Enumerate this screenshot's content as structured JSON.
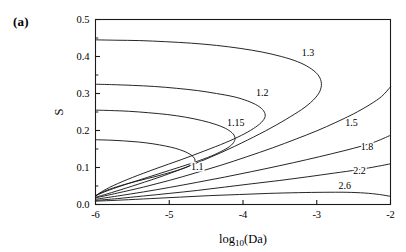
{
  "panel": {
    "label": "(a)"
  },
  "chart_data": {
    "type": "line",
    "title": "",
    "subtitle": "",
    "xlabel": "log10(Da)",
    "xlabel_base": "log",
    "xlabel_sub": "10",
    "xlabel_tail": "(Da)",
    "ylabel": "S",
    "xlim": [
      -6,
      -2
    ],
    "ylim": [
      0.0,
      0.5
    ],
    "grid": false,
    "legend_position": "inline-contour-labels",
    "xticks": [
      "-6",
      "-5",
      "-4",
      "-3",
      "-2"
    ],
    "xtick_values": [
      -6,
      -5,
      -4,
      -3,
      -2
    ],
    "yticks": [
      "0.0",
      "0.1",
      "0.2",
      "0.3",
      "0.4",
      "0.5"
    ],
    "ytick_values": [
      0.0,
      0.1,
      0.2,
      0.3,
      0.4,
      0.5
    ],
    "yminor_values": [
      0.05,
      0.15,
      0.25,
      0.35,
      0.45
    ],
    "contour_levels": [
      1.1,
      1.15,
      1.2,
      1.3,
      1.5,
      1.8,
      2.2,
      2.6
    ],
    "series": [
      {
        "name": "1.1",
        "label": "1.1",
        "label_x": -4.62,
        "label_y": 0.092,
        "shape": "nose",
        "points": [
          [
            -6.0,
            0.175
          ],
          [
            -5.82,
            0.174
          ],
          [
            -5.62,
            0.172
          ],
          [
            -5.42,
            0.169
          ],
          [
            -5.22,
            0.164
          ],
          [
            -5.05,
            0.158
          ],
          [
            -4.92,
            0.152
          ],
          [
            -4.8,
            0.144
          ],
          [
            -4.72,
            0.136
          ],
          [
            -4.67,
            0.128
          ],
          [
            -4.65,
            0.12
          ],
          [
            -4.67,
            0.112
          ],
          [
            -4.73,
            0.104
          ],
          [
            -4.83,
            0.096
          ],
          [
            -4.98,
            0.087
          ],
          [
            -5.18,
            0.076
          ],
          [
            -5.42,
            0.064
          ],
          [
            -5.66,
            0.051
          ],
          [
            -5.84,
            0.039
          ],
          [
            -5.95,
            0.029
          ],
          [
            -6.0,
            0.024
          ]
        ]
      },
      {
        "name": "1.15",
        "label": "1.15",
        "label_x": -4.1,
        "label_y": 0.213,
        "shape": "nose",
        "points": [
          [
            -6.0,
            0.255
          ],
          [
            -5.8,
            0.254
          ],
          [
            -5.55,
            0.252
          ],
          [
            -5.28,
            0.248
          ],
          [
            -5.02,
            0.243
          ],
          [
            -4.78,
            0.236
          ],
          [
            -4.56,
            0.227
          ],
          [
            -4.38,
            0.217
          ],
          [
            -4.24,
            0.206
          ],
          [
            -4.15,
            0.194
          ],
          [
            -4.11,
            0.182
          ],
          [
            -4.12,
            0.17
          ],
          [
            -4.18,
            0.157
          ],
          [
            -4.3,
            0.143
          ],
          [
            -4.48,
            0.127
          ],
          [
            -4.72,
            0.11
          ],
          [
            -5.0,
            0.092
          ],
          [
            -5.3,
            0.073
          ],
          [
            -5.58,
            0.055
          ],
          [
            -5.8,
            0.04
          ],
          [
            -5.94,
            0.029
          ],
          [
            -6.0,
            0.023
          ]
        ]
      },
      {
        "name": "1.2",
        "label": "1.2",
        "label_x": -3.74,
        "label_y": 0.292,
        "shape": "nose",
        "points": [
          [
            -6.0,
            0.325
          ],
          [
            -5.78,
            0.324
          ],
          [
            -5.5,
            0.322
          ],
          [
            -5.2,
            0.319
          ],
          [
            -4.9,
            0.314
          ],
          [
            -4.62,
            0.308
          ],
          [
            -4.36,
            0.3
          ],
          [
            -4.12,
            0.291
          ],
          [
            -3.94,
            0.28
          ],
          [
            -3.8,
            0.267
          ],
          [
            -3.72,
            0.253
          ],
          [
            -3.7,
            0.238
          ],
          [
            -3.75,
            0.222
          ],
          [
            -3.86,
            0.205
          ],
          [
            -4.02,
            0.187
          ],
          [
            -4.24,
            0.167
          ],
          [
            -4.52,
            0.145
          ],
          [
            -4.84,
            0.121
          ],
          [
            -5.18,
            0.097
          ],
          [
            -5.5,
            0.073
          ],
          [
            -5.76,
            0.051
          ],
          [
            -5.92,
            0.034
          ],
          [
            -6.0,
            0.023
          ]
        ]
      },
      {
        "name": "1.3",
        "label": "1.3",
        "label_x": -3.12,
        "label_y": 0.402,
        "shape": "nose",
        "points": [
          [
            -6.0,
            0.445
          ],
          [
            -5.72,
            0.444
          ],
          [
            -5.4,
            0.443
          ],
          [
            -5.05,
            0.44
          ],
          [
            -4.7,
            0.436
          ],
          [
            -4.36,
            0.43
          ],
          [
            -4.04,
            0.422
          ],
          [
            -3.74,
            0.412
          ],
          [
            -3.48,
            0.4
          ],
          [
            -3.26,
            0.386
          ],
          [
            -3.1,
            0.37
          ],
          [
            -2.99,
            0.352
          ],
          [
            -2.94,
            0.332
          ],
          [
            -2.95,
            0.31
          ],
          [
            -3.02,
            0.288
          ],
          [
            -3.16,
            0.263
          ],
          [
            -3.36,
            0.237
          ],
          [
            -3.62,
            0.207
          ],
          [
            -3.94,
            0.174
          ],
          [
            -4.3,
            0.14
          ],
          [
            -4.68,
            0.108
          ],
          [
            -5.06,
            0.079
          ],
          [
            -5.42,
            0.055
          ],
          [
            -5.72,
            0.036
          ],
          [
            -5.92,
            0.024
          ],
          [
            -6.0,
            0.02
          ]
        ]
      },
      {
        "name": "1.5",
        "label": "1.5",
        "label_x": -2.53,
        "label_y": 0.213,
        "shape": "monotonic",
        "points": [
          [
            -6.0,
            0.018
          ],
          [
            -5.7,
            0.031
          ],
          [
            -5.35,
            0.047
          ],
          [
            -5.0,
            0.065
          ],
          [
            -4.65,
            0.085
          ],
          [
            -4.3,
            0.106
          ],
          [
            -3.95,
            0.129
          ],
          [
            -3.6,
            0.153
          ],
          [
            -3.28,
            0.177
          ],
          [
            -3.0,
            0.199
          ],
          [
            -2.74,
            0.222
          ],
          [
            -2.5,
            0.245
          ],
          [
            -2.28,
            0.27
          ],
          [
            -2.12,
            0.292
          ],
          [
            -2.0,
            0.318
          ]
        ]
      },
      {
        "name": "1.8",
        "label": "1.8",
        "label_x": -2.32,
        "label_y": 0.148,
        "shape": "monotonic",
        "points": [
          [
            -6.0,
            0.014
          ],
          [
            -5.7,
            0.023
          ],
          [
            -5.35,
            0.034
          ],
          [
            -5.0,
            0.046
          ],
          [
            -4.62,
            0.06
          ],
          [
            -4.25,
            0.074
          ],
          [
            -3.88,
            0.089
          ],
          [
            -3.5,
            0.105
          ],
          [
            -3.14,
            0.121
          ],
          [
            -2.8,
            0.137
          ],
          [
            -2.5,
            0.152
          ],
          [
            -2.24,
            0.167
          ],
          [
            -2.0,
            0.187
          ]
        ]
      },
      {
        "name": "2.2",
        "label": "2.2",
        "label_x": -2.42,
        "label_y": 0.082,
        "shape": "monotonic",
        "points": [
          [
            -6.0,
            0.011
          ],
          [
            -5.7,
            0.016
          ],
          [
            -5.35,
            0.023
          ],
          [
            -5.0,
            0.03
          ],
          [
            -4.62,
            0.038
          ],
          [
            -4.25,
            0.047
          ],
          [
            -3.88,
            0.056
          ],
          [
            -3.5,
            0.065
          ],
          [
            -3.12,
            0.075
          ],
          [
            -2.76,
            0.085
          ],
          [
            -2.44,
            0.094
          ],
          [
            -2.18,
            0.103
          ],
          [
            -2.0,
            0.11
          ]
        ]
      },
      {
        "name": "2.6",
        "label": "2.6",
        "label_x": -2.62,
        "label_y": 0.042,
        "shape": "monotonic",
        "points": [
          [
            -6.0,
            0.009
          ],
          [
            -5.65,
            0.012
          ],
          [
            -5.25,
            0.016
          ],
          [
            -4.85,
            0.02
          ],
          [
            -4.45,
            0.024
          ],
          [
            -4.05,
            0.027
          ],
          [
            -3.65,
            0.03
          ],
          [
            -3.25,
            0.032
          ],
          [
            -2.9,
            0.033
          ],
          [
            -2.6,
            0.033
          ],
          [
            -2.35,
            0.031
          ],
          [
            -2.15,
            0.027
          ],
          [
            -2.0,
            0.022
          ]
        ]
      }
    ]
  }
}
